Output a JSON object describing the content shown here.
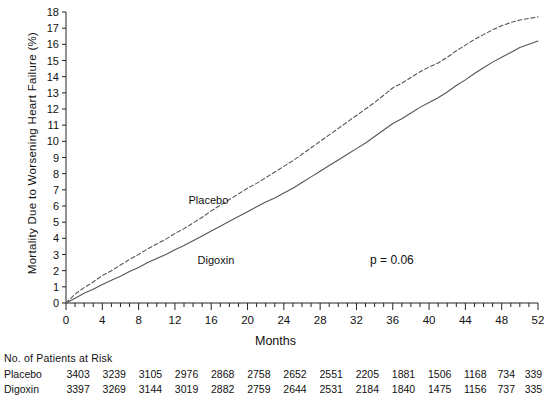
{
  "chart_data": {
    "type": "line",
    "title": "",
    "xlabel": "Months",
    "ylabel": "Mortality Due to Worsening Heart Failure (%)",
    "xlim": [
      0,
      52
    ],
    "ylim": [
      0,
      18
    ],
    "xticks": [
      0,
      4,
      8,
      12,
      16,
      20,
      24,
      28,
      32,
      36,
      40,
      44,
      48,
      52
    ],
    "yticks": [
      0,
      1,
      2,
      3,
      4,
      5,
      6,
      7,
      8,
      9,
      10,
      11,
      12,
      13,
      14,
      15,
      16,
      17,
      18
    ],
    "x_minor_tick_step": 1,
    "y_minor_tick_step": 1,
    "grid": false,
    "legend": "inline-labels",
    "annotation": "p  =  0.06",
    "series": [
      {
        "name": "Placebo",
        "style": "dashed",
        "color": "#555555",
        "label_x": 13.5,
        "label_y": 6.3,
        "x": [
          0,
          1,
          2,
          3,
          4,
          5,
          6,
          7,
          8,
          9,
          10,
          11,
          12,
          13,
          14,
          15,
          16,
          17,
          18,
          19,
          20,
          21,
          22,
          23,
          24,
          25,
          26,
          27,
          28,
          29,
          30,
          31,
          32,
          33,
          34,
          35,
          36,
          37,
          38,
          39,
          40,
          41,
          42,
          43,
          44,
          45,
          46,
          47,
          48,
          49,
          50,
          51,
          52
        ],
        "y": [
          0,
          0.55,
          0.95,
          1.3,
          1.7,
          2.0,
          2.35,
          2.7,
          3.0,
          3.35,
          3.65,
          3.95,
          4.3,
          4.6,
          4.95,
          5.3,
          5.7,
          6.05,
          6.4,
          6.75,
          7.1,
          7.4,
          7.75,
          8.1,
          8.45,
          8.8,
          9.2,
          9.6,
          10.0,
          10.4,
          10.8,
          11.2,
          11.6,
          12.0,
          12.4,
          12.85,
          13.3,
          13.6,
          13.95,
          14.3,
          14.6,
          14.85,
          15.2,
          15.6,
          15.95,
          16.3,
          16.6,
          16.9,
          17.15,
          17.35,
          17.5,
          17.6,
          17.7
        ]
      },
      {
        "name": "Digoxin",
        "style": "solid",
        "color": "#555555",
        "label_x": 14.5,
        "label_y": 2.6,
        "x": [
          0,
          1,
          2,
          3,
          4,
          5,
          6,
          7,
          8,
          9,
          10,
          11,
          12,
          13,
          14,
          15,
          16,
          17,
          18,
          19,
          20,
          21,
          22,
          23,
          24,
          25,
          26,
          27,
          28,
          29,
          30,
          31,
          32,
          33,
          34,
          35,
          36,
          37,
          38,
          39,
          40,
          41,
          42,
          43,
          44,
          45,
          46,
          47,
          48,
          49,
          50,
          51,
          52
        ],
        "y": [
          0,
          0.3,
          0.6,
          0.85,
          1.15,
          1.4,
          1.65,
          1.95,
          2.2,
          2.5,
          2.75,
          3.0,
          3.3,
          3.55,
          3.85,
          4.15,
          4.45,
          4.75,
          5.05,
          5.35,
          5.65,
          5.95,
          6.25,
          6.5,
          6.8,
          7.1,
          7.45,
          7.8,
          8.15,
          8.5,
          8.85,
          9.2,
          9.55,
          9.9,
          10.3,
          10.7,
          11.1,
          11.4,
          11.75,
          12.1,
          12.4,
          12.7,
          13.05,
          13.45,
          13.8,
          14.2,
          14.55,
          14.9,
          15.2,
          15.5,
          15.8,
          16.0,
          16.2
        ]
      }
    ]
  },
  "risk_table": {
    "caption": "No. of Patients at Risk",
    "months": [
      0,
      4,
      8,
      12,
      16,
      20,
      24,
      28,
      32,
      36,
      40,
      44,
      48,
      52
    ],
    "rows": [
      {
        "label": "Placebo",
        "values": [
          3403,
          3239,
          3105,
          2976,
          2868,
          2758,
          2652,
          2551,
          2205,
          1881,
          1506,
          1168,
          734,
          339
        ]
      },
      {
        "label": "Digoxin",
        "values": [
          3397,
          3269,
          3144,
          3019,
          2882,
          2759,
          2644,
          2531,
          2184,
          1840,
          1475,
          1156,
          737,
          335
        ]
      }
    ]
  }
}
